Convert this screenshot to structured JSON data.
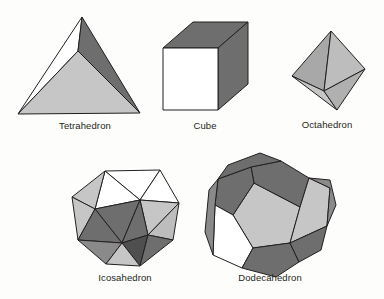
{
  "figure": {
    "background_color": "#fdfdfb",
    "palette": {
      "white_face": "#ffffff",
      "light_gray_face": "#c6c6c6",
      "mid_gray_face": "#a8a8a8",
      "dark_gray_face": "#6e6e6e",
      "edge_stroke": "#231f20",
      "label_color": "#231f20"
    }
  },
  "solids": [
    {
      "id": "tetrahedron",
      "label": "Tetrahedron",
      "faces_total": 4,
      "face_shape": "triangle",
      "visible_faces": [
        "white",
        "dark_gray",
        "light_gray"
      ]
    },
    {
      "id": "cube",
      "label": "Cube",
      "faces_total": 6,
      "face_shape": "square",
      "visible_faces": [
        "white",
        "dark_gray",
        "dark_gray"
      ]
    },
    {
      "id": "octahedron",
      "label": "Octahedron",
      "faces_total": 8,
      "face_shape": "triangle",
      "visible_faces": [
        "mid_gray",
        "light_gray",
        "dark_gray",
        "light_gray"
      ]
    },
    {
      "id": "icosahedron",
      "label": "Icosahedron",
      "faces_total": 20,
      "face_shape": "triangle",
      "visible_faces": [
        "white",
        "light_gray",
        "dark_gray",
        "mid_gray"
      ]
    },
    {
      "id": "dodecahedron",
      "label": "Dodecahedron",
      "faces_total": 12,
      "face_shape": "pentagon",
      "visible_faces": [
        "light_gray",
        "dark_gray",
        "white",
        "mid_gray"
      ]
    }
  ]
}
